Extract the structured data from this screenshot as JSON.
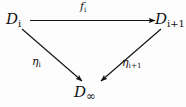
{
  "diagram": {
    "type": "commutative-triangle",
    "background_color": "#fdfdfd",
    "ink_color": "#111111",
    "nodes": [
      {
        "id": "D_i",
        "base": "D",
        "subscript": "i",
        "position": "top-left",
        "x": 6,
        "y": 12
      },
      {
        "id": "D_i+1",
        "base": "D",
        "subscript": "i+1",
        "position": "top-right",
        "x": 155,
        "y": 12
      },
      {
        "id": "D_infinity",
        "base": "D",
        "subscript": "∞",
        "position": "bottom-center",
        "x": 74,
        "y": 85
      }
    ],
    "edges": [
      {
        "id": "f_i",
        "from": "D_i",
        "to": "D_i+1",
        "label_base": "f",
        "label_subscript": "i",
        "direction": "horizontal-right",
        "label_x": 80,
        "label_y": 1
      },
      {
        "id": "eta_i",
        "from": "D_i",
        "to": "D_infinity",
        "label_base": "η",
        "label_subscript": "i",
        "direction": "diagonal-down-right",
        "label_x": 32,
        "label_y": 56
      },
      {
        "id": "eta_i+1",
        "from": "D_i+1",
        "to": "D_infinity",
        "label_base": "η",
        "label_subscript": "i+1",
        "direction": "diagonal-down-left",
        "label_x": 122,
        "label_y": 57
      }
    ]
  }
}
